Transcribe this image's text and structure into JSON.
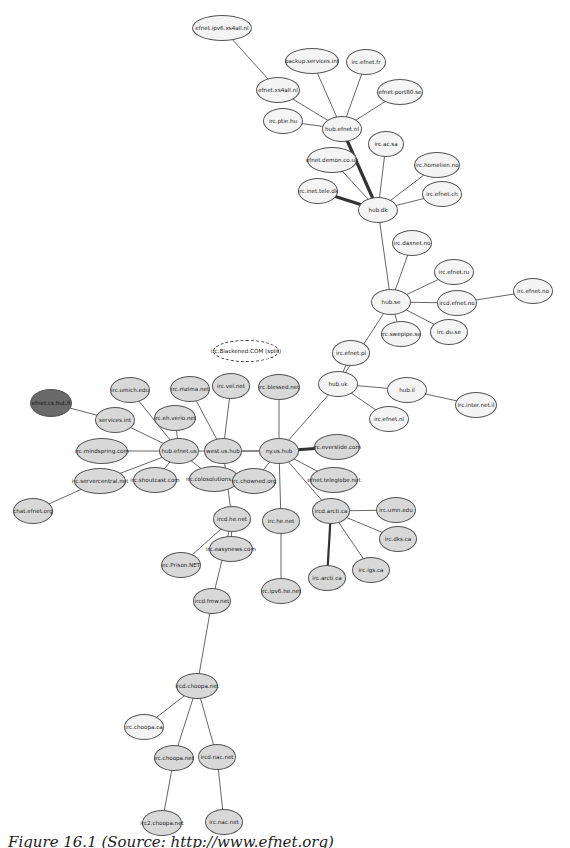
{
  "diagram": {
    "type": "network-graph",
    "nodes": [
      {
        "id": "efnet.ipv6.xs4all.nl",
        "x": 222,
        "y": 28,
        "w": 60,
        "h": 26,
        "style": "white"
      },
      {
        "id": "backup.services.int",
        "x": 312,
        "y": 61,
        "w": 54,
        "h": 26,
        "style": "white"
      },
      {
        "id": "irc.efnet.fr",
        "x": 366,
        "y": 62,
        "w": 40,
        "h": 26,
        "style": "white"
      },
      {
        "id": "efnet.xs4all.nl",
        "x": 278,
        "y": 90,
        "w": 44,
        "h": 26,
        "style": "white"
      },
      {
        "id": "efnet.port80.se",
        "x": 400,
        "y": 92,
        "w": 46,
        "h": 26,
        "style": "white"
      },
      {
        "id": "irc.ptie.hu",
        "x": 283,
        "y": 121,
        "w": 40,
        "h": 26,
        "style": "white"
      },
      {
        "id": "hub.efnet.nl",
        "x": 342,
        "y": 129,
        "w": 40,
        "h": 26,
        "style": "white"
      },
      {
        "id": "irc.ac.sa",
        "x": 386,
        "y": 144,
        "w": 36,
        "h": 26,
        "style": "white"
      },
      {
        "id": "efnet.demon.co.uk",
        "x": 332,
        "y": 160,
        "w": 50,
        "h": 26,
        "style": "white"
      },
      {
        "id": "irc.homelien.no",
        "x": 437,
        "y": 165,
        "w": 46,
        "h": 26,
        "style": "white"
      },
      {
        "id": "irc.inet.tele.dk",
        "x": 318,
        "y": 191,
        "w": 40,
        "h": 26,
        "style": "white"
      },
      {
        "id": "irc.efnet.ch",
        "x": 442,
        "y": 194,
        "w": 40,
        "h": 26,
        "style": "white"
      },
      {
        "id": "hub.dk",
        "x": 378,
        "y": 210,
        "w": 40,
        "h": 26,
        "style": "white"
      },
      {
        "id": "irc.daxnet.no",
        "x": 412,
        "y": 243,
        "w": 40,
        "h": 26,
        "style": "white"
      },
      {
        "id": "irc.efnet.ru",
        "x": 454,
        "y": 272,
        "w": 40,
        "h": 26,
        "style": "white"
      },
      {
        "id": "irc.efnet.no",
        "x": 533,
        "y": 291,
        "w": 40,
        "h": 26,
        "style": "white"
      },
      {
        "id": "hub.se",
        "x": 391,
        "y": 302,
        "w": 40,
        "h": 26,
        "style": "white"
      },
      {
        "id": "ircd.efnet.no",
        "x": 457,
        "y": 303,
        "w": 40,
        "h": 26,
        "style": "white"
      },
      {
        "id": "irc.swepipe.se",
        "x": 401,
        "y": 334,
        "w": 40,
        "h": 26,
        "style": "white"
      },
      {
        "id": "irc.du.se",
        "x": 449,
        "y": 332,
        "w": 38,
        "h": 26,
        "style": "white"
      },
      {
        "id": "irc.Blackened.COM (split)",
        "x": 246,
        "y": 351,
        "w": 66,
        "h": 22,
        "style": "dashed"
      },
      {
        "id": "irc.efnet.pl",
        "x": 351,
        "y": 353,
        "w": 38,
        "h": 26,
        "style": "white"
      },
      {
        "id": "hub.uk",
        "x": 338,
        "y": 384,
        "w": 40,
        "h": 26,
        "style": "white"
      },
      {
        "id": "hub.il",
        "x": 407,
        "y": 390,
        "w": 40,
        "h": 26,
        "style": "white"
      },
      {
        "id": "irc.inter.net.il",
        "x": 476,
        "y": 405,
        "w": 42,
        "h": 26,
        "style": "white"
      },
      {
        "id": "irc.efnet.nl",
        "x": 389,
        "y": 419,
        "w": 40,
        "h": 26,
        "style": "white"
      },
      {
        "id": "efnet.cs.hut.fi",
        "x": 51,
        "y": 403,
        "w": 42,
        "h": 28,
        "style": "dark"
      },
      {
        "id": "irc.umich.edu",
        "x": 130,
        "y": 390,
        "w": 40,
        "h": 26,
        "style": "grey"
      },
      {
        "id": "irc.mzima.net",
        "x": 190,
        "y": 389,
        "w": 40,
        "h": 26,
        "style": "grey"
      },
      {
        "id": "irc.vel.net",
        "x": 231,
        "y": 386,
        "w": 38,
        "h": 26,
        "style": "grey"
      },
      {
        "id": "irc.blessed.net",
        "x": 279,
        "y": 387,
        "w": 42,
        "h": 26,
        "style": "grey"
      },
      {
        "id": "services.int",
        "x": 115,
        "y": 420,
        "w": 40,
        "h": 26,
        "style": "grey"
      },
      {
        "id": "irc.eh.verio.net",
        "x": 175,
        "y": 418,
        "w": 42,
        "h": 26,
        "style": "grey"
      },
      {
        "id": "irc.mindspring.com",
        "x": 102,
        "y": 451,
        "w": 52,
        "h": 26,
        "style": "grey"
      },
      {
        "id": "hub.efnet.us",
        "x": 179,
        "y": 451,
        "w": 40,
        "h": 26,
        "style": "grey"
      },
      {
        "id": "west.us.hub",
        "x": 223,
        "y": 451,
        "w": 38,
        "h": 26,
        "style": "grey"
      },
      {
        "id": "ny.us.hub",
        "x": 279,
        "y": 451,
        "w": 40,
        "h": 26,
        "style": "grey"
      },
      {
        "id": "irc.everslide.com",
        "x": 337,
        "y": 447,
        "w": 46,
        "h": 26,
        "style": "grey"
      },
      {
        "id": "irc.servercentral.net",
        "x": 100,
        "y": 481,
        "w": 52,
        "h": 26,
        "style": "grey"
      },
      {
        "id": "irc.shoutcast.com",
        "x": 155,
        "y": 480,
        "w": 44,
        "h": 26,
        "style": "grey"
      },
      {
        "id": "irc.colosolutions.net",
        "x": 214,
        "y": 479,
        "w": 50,
        "h": 26,
        "style": "grey"
      },
      {
        "id": "irc.chowned.org",
        "x": 254,
        "y": 481,
        "w": 44,
        "h": 26,
        "style": "grey"
      },
      {
        "id": "efnet.teleglobe.net",
        "x": 334,
        "y": 480,
        "w": 48,
        "h": 26,
        "style": "grey"
      },
      {
        "id": "chat.efnet.org",
        "x": 33,
        "y": 511,
        "w": 40,
        "h": 26,
        "style": "grey"
      },
      {
        "id": "ircd.he.net",
        "x": 232,
        "y": 519,
        "w": 38,
        "h": 26,
        "style": "grey"
      },
      {
        "id": "irc.he.net",
        "x": 281,
        "y": 521,
        "w": 38,
        "h": 26,
        "style": "grey"
      },
      {
        "id": "ircd.arcti.ca",
        "x": 331,
        "y": 511,
        "w": 38,
        "h": 26,
        "style": "grey"
      },
      {
        "id": "irc.umn.edu",
        "x": 396,
        "y": 510,
        "w": 40,
        "h": 26,
        "style": "grey"
      },
      {
        "id": "irc.dks.ca",
        "x": 398,
        "y": 539,
        "w": 38,
        "h": 26,
        "style": "grey"
      },
      {
        "id": "irc.easynews.com",
        "x": 231,
        "y": 549,
        "w": 44,
        "h": 26,
        "style": "grey"
      },
      {
        "id": "irc.Prison.NET",
        "x": 181,
        "y": 565,
        "w": 40,
        "h": 26,
        "style": "grey"
      },
      {
        "id": "irc.igs.ca",
        "x": 371,
        "y": 570,
        "w": 38,
        "h": 26,
        "style": "grey"
      },
      {
        "id": "irc.arcti.ca",
        "x": 327,
        "y": 578,
        "w": 38,
        "h": 26,
        "style": "grey"
      },
      {
        "id": "ircd.fmw.net",
        "x": 212,
        "y": 601,
        "w": 38,
        "h": 26,
        "style": "grey"
      },
      {
        "id": "irc.ipv6.he.net",
        "x": 281,
        "y": 591,
        "w": 40,
        "h": 26,
        "style": "grey"
      },
      {
        "id": "ircd.choopa.net",
        "x": 197,
        "y": 686,
        "w": 42,
        "h": 26,
        "style": "grey"
      },
      {
        "id": "irc.choopa.ca",
        "x": 144,
        "y": 727,
        "w": 40,
        "h": 26,
        "style": "white"
      },
      {
        "id": "irc.choopa.net",
        "x": 174,
        "y": 758,
        "w": 40,
        "h": 26,
        "style": "grey"
      },
      {
        "id": "ircd.nac.net",
        "x": 217,
        "y": 757,
        "w": 38,
        "h": 26,
        "style": "grey"
      },
      {
        "id": "irc2.choopa.net",
        "x": 162,
        "y": 823,
        "w": 40,
        "h": 26,
        "style": "grey"
      },
      {
        "id": "irc.nac.net",
        "x": 224,
        "y": 822,
        "w": 38,
        "h": 26,
        "style": "grey"
      }
    ],
    "edges": [
      [
        "efnet.ipv6.xs4all.nl",
        "efnet.xs4all.nl",
        1
      ],
      [
        "efnet.xs4all.nl",
        "hub.efnet.nl",
        1
      ],
      [
        "backup.services.int",
        "hub.efnet.nl",
        1
      ],
      [
        "irc.efnet.fr",
        "hub.efnet.nl",
        1
      ],
      [
        "efnet.port80.se",
        "hub.efnet.nl",
        1
      ],
      [
        "irc.ptie.hu",
        "hub.efnet.nl",
        1
      ],
      [
        "hub.efnet.nl",
        "hub.dk",
        3
      ],
      [
        "efnet.demon.co.uk",
        "hub.dk",
        1
      ],
      [
        "irc.ac.sa",
        "hub.dk",
        1
      ],
      [
        "irc.homelien.no",
        "hub.dk",
        1
      ],
      [
        "irc.efnet.ch",
        "hub.dk",
        1
      ],
      [
        "irc.inet.tele.dk",
        "hub.dk",
        3
      ],
      [
        "hub.dk",
        "hub.se",
        1
      ],
      [
        "irc.daxnet.no",
        "hub.se",
        1
      ],
      [
        "irc.efnet.ru",
        "hub.se",
        1
      ],
      [
        "ircd.efnet.no",
        "hub.se",
        1
      ],
      [
        "ircd.efnet.no",
        "irc.efnet.no",
        1
      ],
      [
        "irc.du.se",
        "hub.se",
        1
      ],
      [
        "irc.swepipe.se",
        "hub.se",
        1
      ],
      [
        "hub.se",
        "hub.uk",
        1
      ],
      [
        "irc.efnet.pl",
        "hub.uk",
        1
      ],
      [
        "hub.uk",
        "hub.il",
        1
      ],
      [
        "hub.il",
        "irc.inter.net.il",
        1
      ],
      [
        "hub.uk",
        "irc.efnet.nl",
        1
      ],
      [
        "hub.uk",
        "ny.us.hub",
        1
      ],
      [
        "efnet.cs.hut.fi",
        "services.int",
        1
      ],
      [
        "services.int",
        "hub.efnet.us",
        1
      ],
      [
        "irc.umich.edu",
        "hub.efnet.us",
        1
      ],
      [
        "irc.eh.verio.net",
        "hub.efnet.us",
        1
      ],
      [
        "irc.mindspring.com",
        "hub.efnet.us",
        1
      ],
      [
        "irc.servercentral.net",
        "hub.efnet.us",
        1
      ],
      [
        "irc.shoutcast.com",
        "hub.efnet.us",
        1
      ],
      [
        "irc.colosolutions.net",
        "hub.efnet.us",
        1
      ],
      [
        "hub.efnet.us",
        "ny.us.hub",
        1
      ],
      [
        "irc.mzima.net",
        "west.us.hub",
        1
      ],
      [
        "irc.vel.net",
        "west.us.hub",
        1
      ],
      [
        "west.us.hub",
        "ny.us.hub",
        1
      ],
      [
        "west.us.hub",
        "ircd.he.net",
        1
      ],
      [
        "irc.blessed.net",
        "ny.us.hub",
        1
      ],
      [
        "ny.us.hub",
        "irc.everslide.com",
        3
      ],
      [
        "ny.us.hub",
        "irc.chowned.org",
        1
      ],
      [
        "ny.us.hub",
        "efnet.teleglobe.net",
        1
      ],
      [
        "ny.us.hub",
        "ircd.arcti.ca",
        1
      ],
      [
        "ny.us.hub",
        "irc.he.net",
        1
      ],
      [
        "irc.servercentral.net",
        "chat.efnet.org",
        1
      ],
      [
        "ircd.arcti.ca",
        "irc.umn.edu",
        1
      ],
      [
        "ircd.arcti.ca",
        "irc.dks.ca",
        1
      ],
      [
        "ircd.arcti.ca",
        "irc.igs.ca",
        1
      ],
      [
        "ircd.arcti.ca",
        "irc.arcti.ca",
        2
      ],
      [
        "irc.he.net",
        "irc.ipv6.he.net",
        1
      ],
      [
        "ircd.he.net",
        "irc.easynews.com",
        1
      ],
      [
        "ircd.he.net",
        "irc.Prison.NET",
        1
      ],
      [
        "ircd.he.net",
        "ircd.fmw.net",
        1
      ],
      [
        "ircd.fmw.net",
        "ircd.choopa.net",
        1
      ],
      [
        "ircd.choopa.net",
        "irc.choopa.ca",
        1
      ],
      [
        "ircd.choopa.net",
        "irc.choopa.net",
        1
      ],
      [
        "ircd.choopa.net",
        "ircd.nac.net",
        1
      ],
      [
        "irc.choopa.net",
        "irc2.choopa.net",
        1
      ],
      [
        "ircd.nac.net",
        "irc.nac.net",
        1
      ]
    ]
  },
  "caption": "Figure 16.1 (Source: http://www.efnet.org)"
}
